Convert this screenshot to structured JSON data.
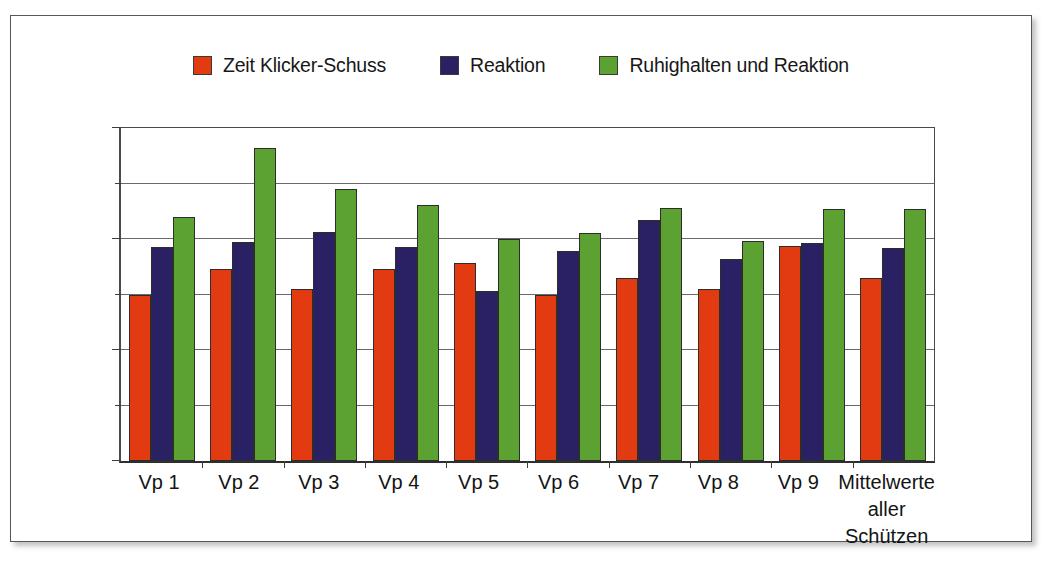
{
  "chart_data": {
    "type": "bar",
    "title": "",
    "subtitle": "",
    "xlabel": "",
    "ylabel": "",
    "ylim": [
      0,
      300
    ],
    "yunit": "ms",
    "grid": true,
    "legend_position": "top-center",
    "y_ticks": [
      "0 ms",
      "100 ms",
      "200 ms",
      "300 ms"
    ],
    "y_tick_values": [
      0,
      100,
      200,
      300
    ],
    "y_minor_tick_values": [
      50,
      150,
      250
    ],
    "categories": [
      "Vp 1",
      "Vp 2",
      "Vp 3",
      "Vp 4",
      "Vp 5",
      "Vp 6",
      "Vp 7",
      "Vp 8",
      "Vp 9",
      "Mittelwerte\naller Schützen"
    ],
    "series": [
      {
        "name": "Zeit Klicker-Schuss",
        "color": "#E23B12",
        "values": [
          150,
          173,
          155,
          173,
          178,
          150,
          165,
          155,
          194,
          165
        ]
      },
      {
        "name": "Reaktion",
        "color": "#2A2064",
        "values": [
          193,
          197,
          206,
          193,
          153,
          189,
          217,
          182,
          196,
          192
        ]
      },
      {
        "name": "Ruhighalten und Reaktion",
        "color": "#5CA233",
        "values": [
          220,
          282,
          245,
          231,
          200,
          205,
          228,
          198,
          227,
          227
        ]
      }
    ]
  },
  "legend": {
    "items": [
      {
        "label": "Zeit Klicker-Schuss",
        "color": "#E23B12"
      },
      {
        "label": "Reaktion",
        "color": "#2A2064"
      },
      {
        "label": "Ruhighalten und Reaktion",
        "color": "#5CA233"
      }
    ]
  }
}
